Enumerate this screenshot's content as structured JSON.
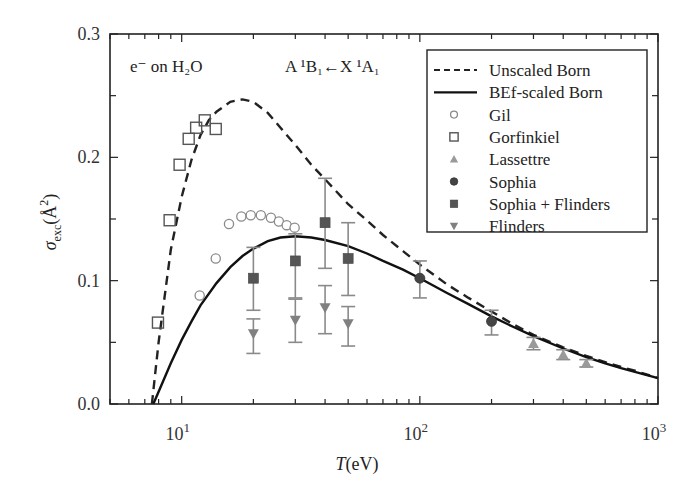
{
  "chart_data": {
    "type": "scatter",
    "title": "",
    "annotations": {
      "projectile": "e⁻ on H₂O",
      "transition": "A ¹B₁←X ¹A₁"
    },
    "xlabel": "T (eV)",
    "ylabel": "σexc (Å²)",
    "xscale": "log",
    "xlim": [
      5,
      1000
    ],
    "ylim": [
      0.0,
      0.3
    ],
    "xticks": [
      {
        "value": 10,
        "label_base": "10",
        "label_exp": "1"
      },
      {
        "value": 100,
        "label_base": "10",
        "label_exp": "2"
      },
      {
        "value": 1000,
        "label_base": "10",
        "label_exp": "3"
      }
    ],
    "yticks": [
      {
        "value": 0.0,
        "label": "0.0"
      },
      {
        "value": 0.1,
        "label": "0.1"
      },
      {
        "value": 0.2,
        "label": "0.2"
      },
      {
        "value": 0.3,
        "label": "0.3"
      }
    ],
    "grid": false,
    "legend_position": "upper right",
    "series": [
      {
        "name": "Unscaled Born",
        "kind": "line",
        "style": "dashed",
        "color": "#222222",
        "x": [
          7.5,
          8,
          9,
          10,
          11,
          12,
          13,
          14,
          16,
          18,
          20,
          23,
          26,
          30,
          35,
          41,
          50,
          59,
          70,
          85,
          100,
          130,
          160,
          200,
          250,
          300,
          400,
          500,
          600,
          700,
          800,
          1000
        ],
        "y": [
          0.0,
          0.05,
          0.125,
          0.168,
          0.198,
          0.218,
          0.23,
          0.237,
          0.245,
          0.247,
          0.245,
          0.236,
          0.224,
          0.21,
          0.194,
          0.18,
          0.162,
          0.15,
          0.137,
          0.124,
          0.113,
          0.097,
          0.086,
          0.075,
          0.064,
          0.056,
          0.046,
          0.039,
          0.034,
          0.03,
          0.027,
          0.021
        ]
      },
      {
        "name": "BEf-scaled Born",
        "kind": "line",
        "style": "solid",
        "color": "#111111",
        "x": [
          7.6,
          8,
          9,
          10,
          11,
          12,
          14,
          16,
          18,
          20,
          23,
          26,
          30,
          35,
          40,
          50,
          60,
          70,
          85,
          100,
          130,
          160,
          200,
          250,
          300,
          400,
          500,
          600,
          700,
          800,
          1000
        ],
        "y": [
          0.0,
          0.01,
          0.033,
          0.052,
          0.067,
          0.08,
          0.098,
          0.111,
          0.12,
          0.126,
          0.132,
          0.135,
          0.136,
          0.135,
          0.133,
          0.128,
          0.122,
          0.116,
          0.109,
          0.102,
          0.09,
          0.081,
          0.071,
          0.062,
          0.055,
          0.045,
          0.038,
          0.033,
          0.029,
          0.026,
          0.021
        ]
      },
      {
        "name": "Gil",
        "kind": "scatter",
        "marker": "open-circle",
        "color": "#8a8a8a",
        "x": [
          11.9,
          13.9,
          15.8,
          17.8,
          19.5,
          21.5,
          23.7,
          25.6,
          27.6,
          29.8
        ],
        "y": [
          0.088,
          0.118,
          0.146,
          0.152,
          0.153,
          0.153,
          0.151,
          0.148,
          0.145,
          0.143
        ]
      },
      {
        "name": "Gorfinkiel",
        "kind": "scatter",
        "marker": "open-square",
        "color": "#555555",
        "x": [
          7.95,
          8.9,
          9.8,
          10.7,
          11.5,
          12.5,
          13.9
        ],
        "y": [
          0.066,
          0.149,
          0.194,
          0.215,
          0.224,
          0.23,
          0.223
        ]
      },
      {
        "name": "Lassettre",
        "kind": "scatter",
        "marker": "triangle-up",
        "color": "#9a9a9a",
        "x": [
          300,
          400,
          500
        ],
        "y": [
          0.049,
          0.04,
          0.033
        ],
        "err_low": [
          0.044,
          0.036,
          0.03
        ],
        "err_high": [
          0.054,
          0.044,
          0.036
        ]
      },
      {
        "name": "Sophia",
        "kind": "scatter",
        "marker": "filled-circle",
        "color": "#444444",
        "x": [
          100,
          200
        ],
        "y": [
          0.102,
          0.067
        ],
        "err_low": [
          0.086,
          0.056
        ],
        "err_high": [
          0.116,
          0.076
        ]
      },
      {
        "name": "Sophia + Flinders",
        "kind": "scatter",
        "marker": "filled-square",
        "color": "#555555",
        "x": [
          20,
          30,
          40,
          50
        ],
        "y": [
          0.102,
          0.116,
          0.147,
          0.118
        ],
        "err_low": [
          0.076,
          0.086,
          0.11,
          0.088
        ],
        "err_high": [
          0.127,
          0.138,
          0.183,
          0.147
        ]
      },
      {
        "name": "Flinders",
        "kind": "scatter",
        "marker": "triangle-down",
        "color": "#808080",
        "x": [
          20,
          30,
          40,
          50
        ],
        "y": [
          0.057,
          0.068,
          0.078,
          0.065
        ],
        "err_low": [
          0.041,
          0.05,
          0.057,
          0.047
        ],
        "err_high": [
          0.069,
          0.085,
          0.096,
          0.079
        ]
      }
    ]
  }
}
